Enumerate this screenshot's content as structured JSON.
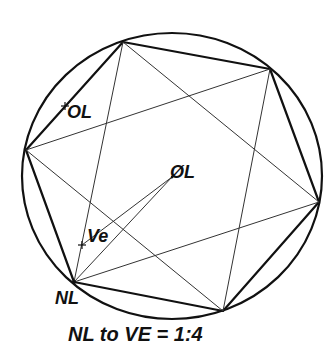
{
  "diagram": {
    "type": "inscribed-hexagon-with-star",
    "circle": {
      "cx": 172,
      "cy": 176,
      "rx": 150,
      "ry": 143
    },
    "vertices": {
      "top": [
        123,
        42
      ],
      "top_right": [
        270,
        69
      ],
      "right": [
        319,
        202
      ],
      "bottom": [
        223,
        311
      ],
      "nl": [
        74,
        282
      ],
      "left": [
        26,
        150
      ]
    },
    "points": {
      "OL": {
        "label": "OL",
        "pos": [
          65,
          106
        ]
      },
      "OslashL": {
        "label": "ØL",
        "pos": [
          172,
          177
        ]
      },
      "Ve": {
        "label": "Ve",
        "pos": [
          82,
          245
        ]
      },
      "NL": {
        "label": "NL",
        "pos": [
          74,
          282
        ]
      }
    },
    "caption": "NL to VE = 1:4"
  },
  "colors": {
    "line": "#111111",
    "thin_line": "#333333",
    "background": "#ffffff"
  }
}
